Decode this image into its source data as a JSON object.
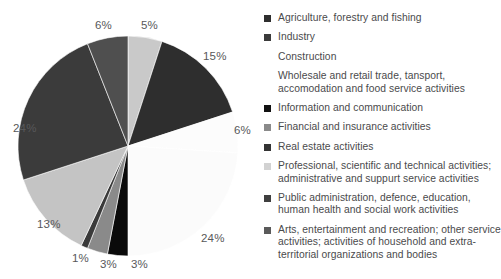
{
  "chart_data": {
    "type": "pie",
    "title": "",
    "subtitle": "",
    "xlabel": "",
    "ylabel": "",
    "legend_position": "right",
    "grid": false,
    "unit": "%",
    "start_angle_deg": 0,
    "direction": "clockwise",
    "categories": [
      "Agriculture, forestry and fishing",
      "Industry",
      "Construction",
      "Wholesale and retail trade, tansport, accomodation and food service activities",
      "Information and communication",
      "Financial and insurance activities",
      "Real estate activities",
      "Professional, scientific and technical activities; administrative and suppurt service activities",
      "Public administration, defence, education, human health and social work activities",
      "Arts, entertainment and recreation; other service activities; activities of household and extra-territorial organizations and bodies"
    ],
    "values": [
      5,
      15,
      6,
      24,
      3,
      3,
      1,
      13,
      24,
      6
    ],
    "data_labels": [
      "5%",
      "15%",
      "6%",
      "24%",
      "3%",
      "3%",
      "1%",
      "13%",
      "24%",
      "6%"
    ],
    "colors": [
      "#c9c9c9",
      "#2e2e2e",
      "#fcfcfc",
      "#fbfbfb",
      "#0a0a0a",
      "#8a8a8a",
      "#3a3a3a",
      "#c4c4c4",
      "#3b3b3b",
      "#4f4f4f"
    ]
  },
  "pie": {
    "center_x": 128,
    "center_y": 146,
    "radius": 110,
    "slices": [
      {
        "id": "slice-agriculture",
        "label": "5%",
        "value": 5,
        "color": "#c9c9c9",
        "label_x": 141,
        "label_y": 19
      },
      {
        "id": "slice-industry",
        "label": "15%",
        "value": 15,
        "color": "#2e2e2e",
        "label_x": 203,
        "label_y": 50
      },
      {
        "id": "slice-construction",
        "label": "6%",
        "value": 6,
        "color": "#fcfcfc",
        "label_x": 234,
        "label_y": 124
      },
      {
        "id": "slice-wholesale",
        "label": "24%",
        "value": 24,
        "color": "#fbfbfb",
        "label_x": 201,
        "label_y": 232
      },
      {
        "id": "slice-information",
        "label": "3%",
        "value": 3,
        "color": "#0a0a0a",
        "label_x": 131,
        "label_y": 258
      },
      {
        "id": "slice-financial",
        "label": "3%",
        "value": 3,
        "color": "#8a8a8a",
        "label_x": 100,
        "label_y": 258
      },
      {
        "id": "slice-realestate",
        "label": "1%",
        "value": 1,
        "color": "#3a3a3a",
        "label_x": 72,
        "label_y": 252
      },
      {
        "id": "slice-professional",
        "label": "13%",
        "value": 13,
        "color": "#c4c4c4",
        "label_x": 37,
        "label_y": 218
      },
      {
        "id": "slice-public-admin",
        "label": "24%",
        "value": 24,
        "color": "#3b3b3b",
        "label_x": 13,
        "label_y": 122
      },
      {
        "id": "slice-arts",
        "label": "6%",
        "value": 6,
        "color": "#4f4f4f",
        "label_x": 95,
        "label_y": 19
      }
    ]
  },
  "legend": {
    "items": [
      {
        "label": "Agriculture, forestry and fishing",
        "color": "#2e2e2e",
        "swatch_visible": true
      },
      {
        "label": "Industry",
        "color": "#3b3b3b",
        "swatch_visible": true
      },
      {
        "label": "Construction",
        "color": "#fdfdfd",
        "swatch_visible": false
      },
      {
        "label": "Wholesale and retail trade, tansport, accomodation and food service activities",
        "color": "#fdfdfd",
        "swatch_visible": false
      },
      {
        "label": "Information and communication",
        "color": "#111111",
        "swatch_visible": true
      },
      {
        "label": "Financial and insurance activities",
        "color": "#8a8a8a",
        "swatch_visible": true
      },
      {
        "label": "Real estate activities",
        "color": "#333333",
        "swatch_visible": true
      },
      {
        "label": "Professional, scientific and technical activities; administrative and suppurt service activities",
        "color": "#d2d2d2",
        "swatch_visible": true
      },
      {
        "label": "Public administration, defence, education, human health and social work activities",
        "color": "#3f3f3f",
        "swatch_visible": true
      },
      {
        "label": "Arts, entertainment and recreation; other service activities; activities of household and extra-territorial organizations and bodies",
        "color": "#5a5a5a",
        "swatch_visible": true
      }
    ]
  }
}
